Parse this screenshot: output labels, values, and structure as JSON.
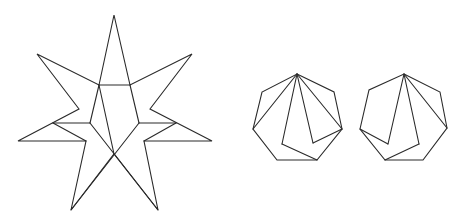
{
  "figure": {
    "width": 458,
    "height": 221,
    "stroke_color": "#2a2a2a",
    "background": "#ffffff"
  },
  "shapes": [
    {
      "name": "seven-pointed-star-dissection",
      "outline": [
        [
          114,
          15
        ],
        [
          130,
          85
        ],
        [
          192,
          54
        ],
        [
          150,
          109
        ],
        [
          212,
          141
        ],
        [
          144,
          141
        ],
        [
          158,
          210
        ],
        [
          114,
          154
        ],
        [
          71,
          210
        ],
        [
          86,
          141
        ],
        [
          18,
          141
        ],
        [
          79,
          109
        ],
        [
          37,
          54
        ],
        [
          99,
          85
        ]
      ],
      "segments": [
        [
          [
            99,
            85
          ],
          [
            130,
            85
          ]
        ],
        [
          [
            99,
            85
          ],
          [
            90,
            123
          ]
        ],
        [
          [
            130,
            85
          ],
          [
            139,
            123
          ]
        ],
        [
          [
            53,
            123
          ],
          [
            90,
            123
          ]
        ],
        [
          [
            139,
            123
          ],
          [
            176,
            123
          ]
        ],
        [
          [
            53,
            123
          ],
          [
            86,
            141
          ]
        ],
        [
          [
            176,
            123
          ],
          [
            144,
            141
          ]
        ],
        [
          [
            90,
            123
          ],
          [
            158,
            210
          ]
        ],
        [
          [
            139,
            123
          ],
          [
            71,
            210
          ]
        ],
        [
          [
            99,
            85
          ],
          [
            114,
            154
          ]
        ]
      ]
    },
    {
      "name": "heptagon-dissection-1",
      "outline": [
        [
          297,
          74
        ],
        [
          334,
          92
        ],
        [
          342,
          129
        ],
        [
          317,
          160
        ],
        [
          277,
          160
        ],
        [
          253,
          129
        ],
        [
          262,
          92
        ]
      ],
      "segments": [
        [
          [
            297,
            74
          ],
          [
            253,
            129
          ]
        ],
        [
          [
            297,
            74
          ],
          [
            282,
            144
          ]
        ],
        [
          [
            282,
            144
          ],
          [
            317,
            160
          ]
        ],
        [
          [
            297,
            74
          ],
          [
            313,
            143
          ]
        ],
        [
          [
            313,
            143
          ],
          [
            342,
            129
          ]
        ],
        [
          [
            297,
            74
          ],
          [
            342,
            129
          ]
        ]
      ]
    },
    {
      "name": "heptagon-dissection-2",
      "outline": [
        [
          404,
          74
        ],
        [
          440,
          92
        ],
        [
          447,
          128
        ],
        [
          423,
          160
        ],
        [
          385,
          160
        ],
        [
          360,
          129
        ],
        [
          369,
          90
        ]
      ],
      "segments": [
        [
          [
            404,
            74
          ],
          [
            388,
            144
          ]
        ],
        [
          [
            360,
            129
          ],
          [
            388,
            144
          ]
        ],
        [
          [
            404,
            74
          ],
          [
            419,
            144
          ]
        ],
        [
          [
            419,
            144
          ],
          [
            385,
            160
          ]
        ],
        [
          [
            404,
            74
          ],
          [
            447,
            128
          ]
        ]
      ]
    }
  ]
}
